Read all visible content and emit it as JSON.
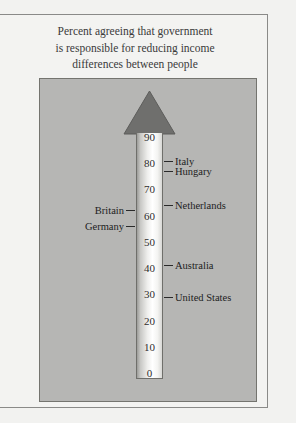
{
  "title": {
    "line1": "Percent agreeing that government",
    "line2": "is responsible for reducing income",
    "line3": "differences between people"
  },
  "colors": {
    "page_background": "#f2f2f0",
    "panel_background": "#b6b6b4",
    "panel_border": "#74746f",
    "frame_border": "#8a8a88",
    "arrow_fill": "#6f6f6d",
    "column_light": "#ffffff",
    "text": "#2e2e2e"
  },
  "chart_data": {
    "type": "bar",
    "title": "Percent agreeing that government is responsible for reducing income differences between people",
    "xlabel": "",
    "ylabel": "Percent agreeing",
    "ylim": [
      0,
      95
    ],
    "grid": false,
    "legend": null,
    "axis_ticks": [
      0,
      10,
      20,
      30,
      40,
      50,
      60,
      70,
      80,
      90
    ],
    "categories": [
      "Italy",
      "Hungary",
      "Netherlands",
      "Britain",
      "Germany",
      "Australia",
      "United States"
    ],
    "values": [
      81,
      77,
      64,
      62,
      56,
      41,
      29
    ],
    "annotations": [
      {
        "label": "Italy",
        "value": 81,
        "side": "right"
      },
      {
        "label": "Hungary",
        "value": 77,
        "side": "right"
      },
      {
        "label": "Netherlands",
        "value": 64,
        "side": "right"
      },
      {
        "label": "Britain",
        "value": 62,
        "side": "left"
      },
      {
        "label": "Germany",
        "value": 56,
        "side": "left"
      },
      {
        "label": "Australia",
        "value": 41,
        "side": "right"
      },
      {
        "label": "United States",
        "value": 29,
        "side": "right"
      }
    ]
  },
  "scale": {
    "ticks": [
      {
        "label": "90",
        "value": 90
      },
      {
        "label": "80",
        "value": 80
      },
      {
        "label": "70",
        "value": 70
      },
      {
        "label": "60",
        "value": 60
      },
      {
        "label": "50",
        "value": 50
      },
      {
        "label": "40",
        "value": 40
      },
      {
        "label": "30",
        "value": 30
      },
      {
        "label": "20",
        "value": 20
      },
      {
        "label": "10",
        "value": 10
      },
      {
        "label": "0",
        "value": 0
      }
    ]
  }
}
